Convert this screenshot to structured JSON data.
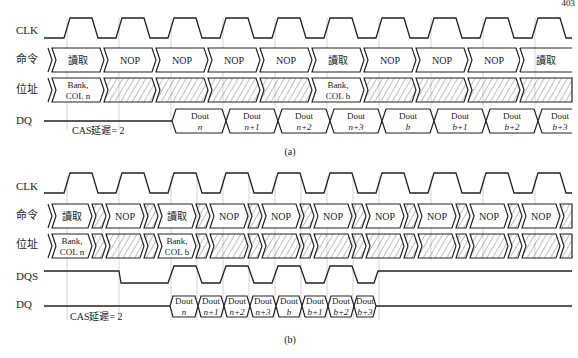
{
  "page": {
    "page_number": "403",
    "header_partial": ""
  },
  "diagram_a": {
    "caption": "(a)",
    "signals": {
      "clk": "CLK",
      "cmd": "命令",
      "addr": "位址",
      "dq": "DQ"
    },
    "commands": [
      "讀取",
      "NOP",
      "NOP",
      "NOP",
      "NOP",
      "讀取",
      "NOP",
      "NOP",
      "NOP",
      "讀取",
      "NOP"
    ],
    "addresses": [
      {
        "line1": "Bank,",
        "line2": "COL n",
        "hatched": false
      },
      {
        "hatched": true
      },
      {
        "hatched": true
      },
      {
        "hatched": true
      },
      {
        "hatched": true
      },
      {
        "line1": "Bank,",
        "line2": "COL b",
        "hatched": false
      },
      {
        "hatched": true
      },
      {
        "hatched": true
      },
      {
        "hatched": true
      },
      {
        "hatched": true
      },
      {
        "hatched": true
      }
    ],
    "dq_outputs": [
      {
        "line1": "Dout",
        "line2": "n"
      },
      {
        "line1": "Dout",
        "line2": "n+1"
      },
      {
        "line1": "Dout",
        "line2": "n+2"
      },
      {
        "line1": "Dout",
        "line2": "n+3"
      },
      {
        "line1": "Dout",
        "line2": "b"
      },
      {
        "line1": "Dout",
        "line2": "b+1"
      },
      {
        "line1": "Dout",
        "line2": "b+2"
      },
      {
        "line1": "Dout",
        "line2": "b+3"
      }
    ],
    "cas_latency_label": "CAS延遲= 2"
  },
  "diagram_b": {
    "caption": "(b)",
    "signals": {
      "clk": "CLK",
      "cmd": "命令",
      "addr": "位址",
      "dqs": "DQS",
      "dq": "DQ"
    },
    "commands": [
      "讀取",
      "NOP",
      "讀取",
      "NOP",
      "NOP",
      "NOP",
      "NOP",
      "NOP",
      "NOP",
      "NOP"
    ],
    "addresses": [
      {
        "line1": "Bank,",
        "line2": "COL n"
      },
      {
        "line1": "Bank,",
        "line2": "COL b"
      }
    ],
    "dq_outputs": [
      {
        "line1": "Dout",
        "line2": "n"
      },
      {
        "line1": "Dout",
        "line2": "n+1"
      },
      {
        "line1": "Dout",
        "line2": "n+2"
      },
      {
        "line1": "Dout",
        "line2": "n+3"
      },
      {
        "line1": "Dout",
        "line2": "b"
      },
      {
        "line1": "Dout",
        "line2": "b+1"
      },
      {
        "line1": "Dout",
        "line2": "b+2"
      },
      {
        "line1": "Dout",
        "line2": "b+3"
      }
    ],
    "cas_latency_label": "CAS延遲= 2"
  }
}
